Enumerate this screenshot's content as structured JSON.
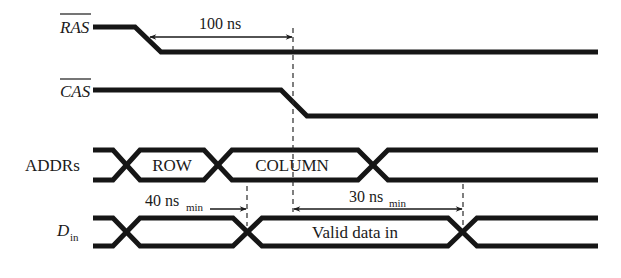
{
  "diagram": {
    "type": "timing-diagram",
    "signals": [
      {
        "id": "ras",
        "label": "RAS",
        "active_low": true,
        "italic": true
      },
      {
        "id": "cas",
        "label": "CAS",
        "active_low": true,
        "italic": true
      },
      {
        "id": "addrs",
        "label": "ADDRs",
        "active_low": false,
        "italic": false
      },
      {
        "id": "din",
        "label": "D",
        "subscript": "in",
        "active_low": false,
        "italic": true
      }
    ],
    "bus_values": {
      "addrs": [
        "ROW",
        "COLUMN"
      ],
      "din": [
        "Valid data in"
      ]
    },
    "annotations": [
      {
        "id": "t-ras-cas",
        "value": "100 ns",
        "subscript": ""
      },
      {
        "id": "t-setup",
        "value": "40 ns",
        "subscript": "min"
      },
      {
        "id": "t-hold",
        "value": "30 ns",
        "subscript": "min"
      }
    ],
    "colors": {
      "line": "#161616",
      "background": "#ffffff"
    }
  }
}
